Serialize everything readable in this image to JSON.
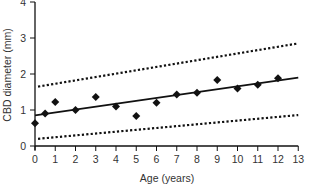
{
  "chart_data": {
    "type": "scatter",
    "title": "",
    "xlabel": "Age (years)",
    "ylabel": "CBD diameter (mm)",
    "xlim": [
      0,
      13
    ],
    "ylim": [
      0,
      4
    ],
    "xticks": [
      0,
      1,
      2,
      3,
      4,
      5,
      6,
      7,
      8,
      9,
      10,
      11,
      12,
      13
    ],
    "yticks": [
      0,
      1,
      2,
      3,
      4
    ],
    "grid": false,
    "legend": null,
    "series": [
      {
        "name": "Measured CBD diameter",
        "type": "scatter",
        "marker": "diamond",
        "x": [
          0,
          0.5,
          1,
          2,
          3,
          4,
          5,
          6,
          7,
          8,
          9,
          10,
          11,
          12
        ],
        "y": [
          0.63,
          0.9,
          1.22,
          1.0,
          1.36,
          1.1,
          0.83,
          1.2,
          1.43,
          1.48,
          1.83,
          1.6,
          1.7,
          1.88
        ]
      },
      {
        "name": "Regression line",
        "type": "line",
        "style": "solid",
        "x": [
          0,
          13
        ],
        "y": [
          0.85,
          1.9
        ]
      },
      {
        "name": "Upper limit",
        "type": "line",
        "style": "dotted",
        "x": [
          0.15,
          13
        ],
        "y": [
          1.65,
          2.85
        ]
      },
      {
        "name": "Lower limit",
        "type": "line",
        "style": "dotted",
        "x": [
          0.15,
          13
        ],
        "y": [
          0.2,
          0.86
        ]
      }
    ]
  },
  "colors": {
    "ink": "#111111",
    "text": "#333333",
    "background": "#ffffff"
  }
}
